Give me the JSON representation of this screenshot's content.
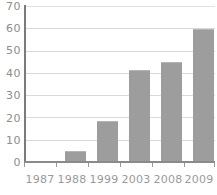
{
  "chart_data": {
    "type": "bar",
    "title": "",
    "subtitle": "",
    "xlabel": "",
    "ylabel": "",
    "categories": [
      "1987",
      "1988",
      "1999",
      "2003",
      "2008",
      "2009"
    ],
    "values": [
      0,
      5,
      18.5,
      41.5,
      45,
      59.5
    ],
    "ylim": [
      0,
      70
    ],
    "xlim": null,
    "yticks": [
      0,
      10,
      20,
      30,
      40,
      50,
      60,
      70
    ],
    "ytick_labels": [
      "0",
      "10",
      "20",
      "30",
      "40",
      "50",
      "60",
      "70"
    ],
    "grid": true,
    "grid_axis": "y",
    "legend": false,
    "legend_position": "none",
    "annotations": [],
    "series": [
      {
        "name": "",
        "values": [
          0,
          5,
          18.5,
          41.5,
          45,
          59.5
        ]
      }
    ]
  },
  "style": {
    "bar_color": "#9d9d9d",
    "bar_edge_color": "#b4b4b4",
    "grid_color": "#d9d9d9",
    "axis_color": "#8a8a8a",
    "tick_label_color": "#9a9a9a",
    "y_label_color": "#8d8d8d",
    "background": "#ffffff"
  }
}
